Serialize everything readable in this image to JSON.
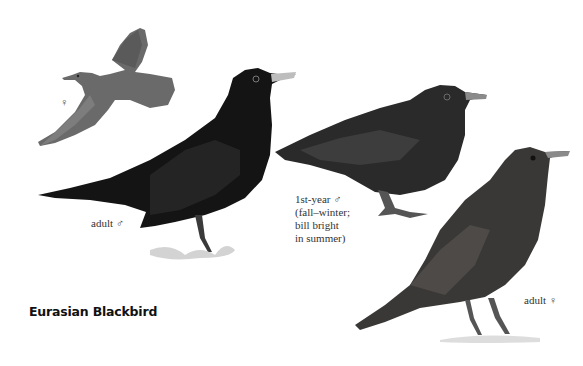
{
  "plate": {
    "title": "Eurasian Blackbird",
    "background": "#ffffff",
    "figures": [
      {
        "id": "flight-female",
        "caption": "♀"
      },
      {
        "id": "adult-male",
        "caption": "adult ♂"
      },
      {
        "id": "first-year-male",
        "caption_lines": [
          "1st-year ♂",
          "(fall–winter;",
          "bill bright",
          "in summer)"
        ]
      },
      {
        "id": "adult-female",
        "caption": "adult ♀"
      }
    ],
    "colors": {
      "male_plumage": "#141414",
      "first_year_plumage": "#2a2a2a",
      "female_plumage": "#3a3836",
      "flight_female": "#6a6a6a",
      "male_bill": "#bdbdbd",
      "grass": "#c8c8c8"
    }
  }
}
